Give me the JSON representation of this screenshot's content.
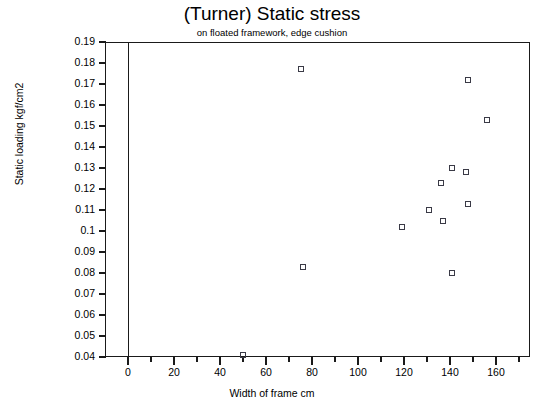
{
  "chart_data": {
    "type": "scatter",
    "title": "(Turner) Static stress",
    "subtitle": "on floated framework, edge cushion",
    "xlabel": "Width of frame cm",
    "ylabel": "Static loading kgf/cm2",
    "xlim": [
      -10,
      175
    ],
    "ylim": [
      0.04,
      0.19
    ],
    "grid": false,
    "legend": null,
    "x_ticks": [
      0,
      20,
      40,
      60,
      80,
      100,
      120,
      140,
      160
    ],
    "x_minor_ticks": [
      10,
      30,
      50,
      70,
      90,
      110,
      130,
      150,
      170
    ],
    "y_ticks": [
      "0.04",
      "0.05",
      "0.06",
      "0.07",
      "0.08",
      "0.09",
      "0.1",
      "0.11",
      "0.12",
      "0.13",
      "0.14",
      "0.15",
      "0.16",
      "0.17",
      "0.18",
      "0.19"
    ],
    "marker_style": "open-square",
    "marker_color": "#3a3a46",
    "series": [
      {
        "name": "edge cushion",
        "points": [
          {
            "x": 50,
            "y": 0.041
          },
          {
            "x": 75,
            "y": 0.177
          },
          {
            "x": 76,
            "y": 0.083
          },
          {
            "x": 119,
            "y": 0.102
          },
          {
            "x": 131,
            "y": 0.11
          },
          {
            "x": 137,
            "y": 0.105
          },
          {
            "x": 136,
            "y": 0.123
          },
          {
            "x": 141,
            "y": 0.13
          },
          {
            "x": 141,
            "y": 0.08
          },
          {
            "x": 147,
            "y": 0.128
          },
          {
            "x": 148,
            "y": 0.113
          },
          {
            "x": 148,
            "y": 0.172
          },
          {
            "x": 156,
            "y": 0.153
          }
        ]
      }
    ]
  },
  "axes": {
    "y_labels": [
      "0.19",
      "0.18",
      "0.17",
      "0.16",
      "0.15",
      "0.14",
      "0.13",
      "0.12",
      "0.11",
      "0.1",
      "0.09",
      "0.08",
      "0.07",
      "0.06",
      "0.05",
      "0.04"
    ],
    "x_labels": [
      "0",
      "20",
      "40",
      "60",
      "80",
      "100",
      "120",
      "140",
      "160"
    ]
  }
}
